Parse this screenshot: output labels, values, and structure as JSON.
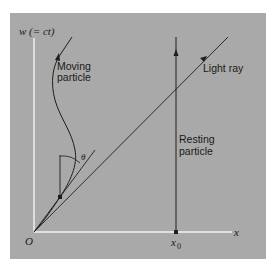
{
  "diagram": {
    "colors": {
      "panel": "#a9a9a9",
      "axis": "#f4f4f4",
      "line": "#1e1e1e"
    },
    "axes": {
      "vertical_label": "w (= ct)",
      "horizontal_label": "x",
      "origin_label": "O",
      "x0_label": "x",
      "x0_subscript": "0"
    },
    "labels": {
      "moving_particle_line1": "Moving",
      "moving_particle_line2": "particle",
      "light_ray": "Light ray",
      "resting_particle_line1": "Resting",
      "resting_particle_line2": "particle",
      "angle": "θ"
    }
  }
}
